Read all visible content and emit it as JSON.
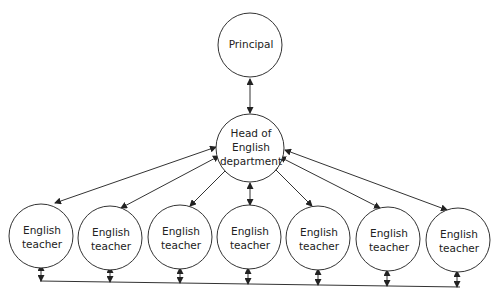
{
  "diagram": {
    "title": "",
    "nodes": {
      "principal": {
        "label_lines": [
          "Principal"
        ]
      },
      "head": {
        "label_lines": [
          "Head of",
          "English",
          "department"
        ]
      },
      "teachers": [
        {
          "label_lines": [
            "English",
            "teacher"
          ]
        },
        {
          "label_lines": [
            "English",
            "teacher"
          ]
        },
        {
          "label_lines": [
            "English",
            "teacher"
          ]
        },
        {
          "label_lines": [
            "English",
            "teacher"
          ]
        },
        {
          "label_lines": [
            "English",
            "teacher"
          ]
        },
        {
          "label_lines": [
            "English",
            "teacher"
          ]
        },
        {
          "label_lines": [
            "English",
            "teacher"
          ]
        }
      ]
    },
    "edges": [
      {
        "from": "principal",
        "to": "head",
        "type": "bidirectional"
      },
      {
        "from": "head",
        "to": "teacher-1",
        "type": "bidirectional"
      },
      {
        "from": "head",
        "to": "teacher-2",
        "type": "bidirectional"
      },
      {
        "from": "head",
        "to": "teacher-3",
        "type": "bidirectional"
      },
      {
        "from": "head",
        "to": "teacher-4",
        "type": "bidirectional"
      },
      {
        "from": "head",
        "to": "teacher-5",
        "type": "bidirectional"
      },
      {
        "from": "head",
        "to": "teacher-6",
        "type": "bidirectional"
      },
      {
        "from": "head",
        "to": "teacher-7",
        "type": "bidirectional"
      },
      {
        "from": "teachers",
        "to": "shared-bottom-line",
        "type": "bidirectional"
      }
    ],
    "colors": {
      "stroke": "#333333",
      "text": "#222222",
      "background": "#ffffff"
    }
  }
}
